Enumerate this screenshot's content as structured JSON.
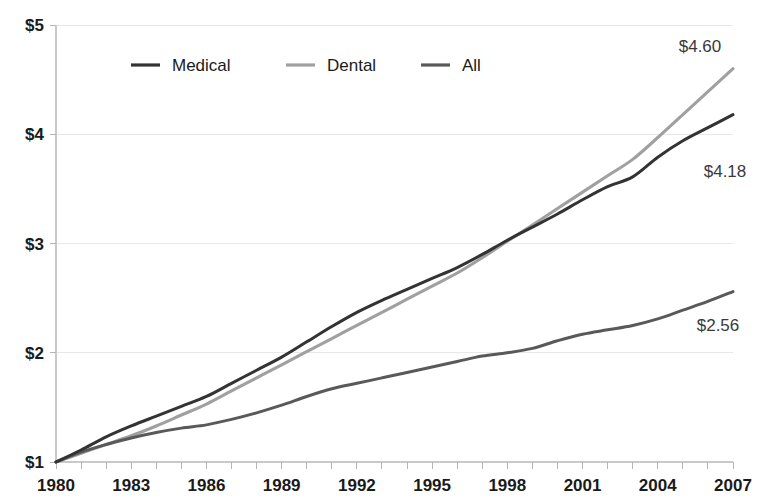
{
  "chart_data": {
    "type": "line",
    "title": "",
    "subtitle": "",
    "xlabel": "",
    "ylabel": "",
    "grid": true,
    "legend_position": "top-left-inside",
    "x": [
      1980,
      1981,
      1982,
      1983,
      1984,
      1985,
      1986,
      1987,
      1988,
      1989,
      1990,
      1991,
      1992,
      1993,
      1994,
      1995,
      1996,
      1997,
      1998,
      1999,
      2000,
      2001,
      2002,
      2003,
      2004,
      2005,
      2006,
      2007
    ],
    "xlim": [
      1980,
      2007
    ],
    "ylim": [
      1,
      5
    ],
    "x_tick_labels": [
      "1980",
      "1983",
      "1986",
      "1989",
      "1992",
      "1995",
      "1998",
      "2001",
      "2004",
      "2007"
    ],
    "x_tick_values": [
      1980,
      1983,
      1986,
      1989,
      1992,
      1995,
      1998,
      2001,
      2004,
      2007
    ],
    "y_tick_labels": [
      "$1",
      "$2",
      "$3",
      "$4",
      "$5"
    ],
    "y_tick_values": [
      1,
      2,
      3,
      4,
      5
    ],
    "series": [
      {
        "name": "Medical",
        "color": "#333333",
        "end_label": "$4.18",
        "values": [
          1.0,
          1.11,
          1.23,
          1.33,
          1.42,
          1.51,
          1.6,
          1.72,
          1.84,
          1.96,
          2.1,
          2.24,
          2.37,
          2.48,
          2.58,
          2.68,
          2.78,
          2.9,
          3.03,
          3.15,
          3.27,
          3.4,
          3.52,
          3.61,
          3.79,
          3.94,
          4.06,
          4.18
        ]
      },
      {
        "name": "Dental",
        "color": "#a0a0a0",
        "end_label": "$4.60",
        "values": [
          1.0,
          1.08,
          1.16,
          1.24,
          1.33,
          1.43,
          1.53,
          1.65,
          1.77,
          1.89,
          2.01,
          2.13,
          2.25,
          2.37,
          2.49,
          2.61,
          2.73,
          2.87,
          3.02,
          3.17,
          3.32,
          3.47,
          3.62,
          3.77,
          3.97,
          4.18,
          4.39,
          4.6
        ]
      },
      {
        "name": "All",
        "color": "#595959",
        "end_label": "$2.56",
        "values": [
          1.0,
          1.09,
          1.16,
          1.22,
          1.27,
          1.31,
          1.34,
          1.39,
          1.45,
          1.52,
          1.6,
          1.67,
          1.72,
          1.77,
          1.82,
          1.87,
          1.92,
          1.97,
          2.0,
          2.04,
          2.11,
          2.17,
          2.21,
          2.25,
          2.31,
          2.39,
          2.47,
          2.56
        ]
      }
    ],
    "annotations": [
      {
        "text": "$4.60",
        "series": "Dental"
      },
      {
        "text": "$4.18",
        "series": "Medical"
      },
      {
        "text": "$2.56",
        "series": "All"
      }
    ]
  },
  "legend": {
    "items": [
      {
        "label": "Medical",
        "color": "#333333"
      },
      {
        "label": "Dental",
        "color": "#a0a0a0"
      },
      {
        "label": "All",
        "color": "#595959"
      }
    ]
  }
}
